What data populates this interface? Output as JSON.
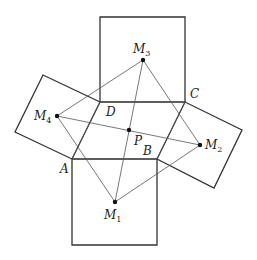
{
  "diagram": {
    "colors": {
      "stroke": "#333333",
      "thin_stroke": "#555555",
      "point": "#111111",
      "background": "#ffffff"
    },
    "quadrilateral": {
      "vertices": {
        "A": [
          72,
          159
        ],
        "B": [
          157,
          159
        ],
        "C": [
          185,
          102
        ],
        "D": [
          100,
          102
        ]
      }
    },
    "squares": [
      {
        "name": "square-bottom",
        "points": [
          [
            72,
            159
          ],
          [
            157,
            159
          ],
          [
            157,
            245
          ],
          [
            72,
            245
          ]
        ]
      },
      {
        "name": "square-right",
        "points": [
          [
            157,
            159
          ],
          [
            185,
            102
          ],
          [
            242,
            130
          ],
          [
            214,
            188
          ]
        ]
      },
      {
        "name": "square-top",
        "points": [
          [
            185,
            102
          ],
          [
            100,
            102
          ],
          [
            100,
            17
          ],
          [
            185,
            17
          ]
        ]
      },
      {
        "name": "square-left",
        "points": [
          [
            100,
            102
          ],
          [
            72,
            159
          ],
          [
            15,
            132
          ],
          [
            43,
            75
          ]
        ]
      }
    ],
    "points": {
      "M1": [
        115,
        202
      ],
      "M2": [
        200,
        145
      ],
      "M3": [
        143,
        60
      ],
      "M4": [
        57,
        116
      ],
      "P": [
        129,
        130
      ]
    },
    "labels": [
      {
        "id": "label-A",
        "text": "A",
        "sub": "",
        "x": 60,
        "y": 173
      },
      {
        "id": "label-B",
        "text": "B",
        "sub": "",
        "x": 143,
        "y": 155
      },
      {
        "id": "label-C",
        "text": "C",
        "sub": "",
        "x": 190,
        "y": 98
      },
      {
        "id": "label-D",
        "text": "D",
        "sub": "",
        "x": 106,
        "y": 116
      },
      {
        "id": "label-P",
        "text": "P",
        "sub": "",
        "x": 134,
        "y": 145
      },
      {
        "id": "label-M1",
        "text": "M",
        "sub": "1",
        "x": 104,
        "y": 219
      },
      {
        "id": "label-M2",
        "text": "M",
        "sub": "2",
        "x": 205,
        "y": 149
      },
      {
        "id": "label-M3",
        "text": "M",
        "sub": "3",
        "x": 133,
        "y": 53
      },
      {
        "id": "label-M4",
        "text": "M",
        "sub": "4",
        "x": 34,
        "y": 120
      }
    ]
  }
}
